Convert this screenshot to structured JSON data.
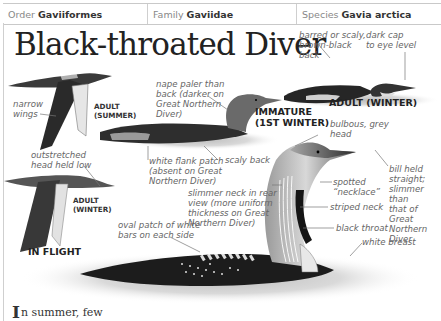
{
  "header": {
    "order": {
      "label": "Order",
      "value": "Gaviiformes"
    },
    "family": {
      "label": "Family",
      "value": "Gaviidae"
    },
    "species": {
      "label": "Species",
      "value": "Gavia arctica"
    }
  },
  "title": "Black-throated Diver",
  "illustrations": {
    "flight_summer": {
      "caption_line1": "ADULT",
      "caption_line2": "(SUMMER)"
    },
    "flight_winter": {
      "caption_line1": "ADULT",
      "caption_line2": "(WINTER)"
    },
    "in_flight_label": "IN FLIGHT",
    "immature": {
      "caption_line1": "IMMATURE",
      "caption_line2": "(1ST WINTER)"
    },
    "adult_winter": {
      "caption": "ADULT (WINTER)"
    }
  },
  "annotations": {
    "narrow_wings": [
      "narrow",
      "wings"
    ],
    "outstretched_head": [
      "outstretched",
      "head held low"
    ],
    "nape_paler": [
      "nape paler than",
      "back (darker on",
      "Great Northern",
      "Diver)"
    ],
    "white_flank": [
      "white flank patch",
      "(absent on Great",
      "Northern Diver)"
    ],
    "scaly_back": [
      "scaly back"
    ],
    "barred_back": [
      "barred or scaly,",
      "brown-black",
      "back"
    ],
    "dark_cap": [
      "dark cap",
      "to eye level"
    ],
    "bulbous_head": [
      "bulbous, grey",
      "head"
    ],
    "bill_held": [
      "bill held",
      "straight;",
      "slimmer than",
      "that of Great",
      "Northern",
      "Diver"
    ],
    "spotted_necklace": [
      "spotted",
      "“necklace”"
    ],
    "slimmer_neck": [
      "slimmer neck in rear",
      "view (more uniform",
      "thickness on Great",
      "Northern Diver)"
    ],
    "striped_neck": [
      "striped neck"
    ],
    "black_throat": [
      "black throat"
    ],
    "oval_patch": [
      "oval patch of white",
      "bars on each side"
    ],
    "white_breast": [
      "white breast"
    ]
  },
  "intro": {
    "dropcap": "I",
    "text": "n summer, few"
  },
  "colors": {
    "bird_dark": "#1e1e1e",
    "bird_grey": "#8a8a8a",
    "water": "#d8d8d8",
    "rule": "#c9c9c9"
  }
}
